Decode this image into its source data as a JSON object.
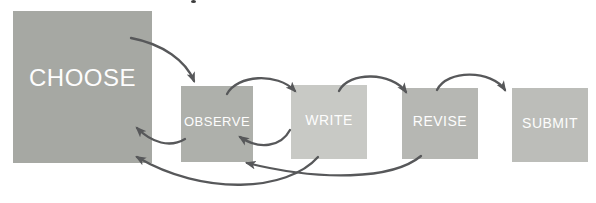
{
  "diagram": {
    "background_color": "#ffffff",
    "arrow_color": "#57585a",
    "label_color": "#fdfdfd",
    "boxes": [
      {
        "id": "choose",
        "label": "CHOOSE",
        "x": 13,
        "y": 11,
        "w": 139,
        "h": 152,
        "color": "#a6a8a3",
        "font_size": 24
      },
      {
        "id": "observe",
        "label": "OBSERVE",
        "x": 181,
        "y": 86,
        "w": 72,
        "h": 76,
        "color": "#aeb0ab",
        "font_size": 13
      },
      {
        "id": "write",
        "label": "WRITE",
        "x": 291,
        "y": 85,
        "w": 76,
        "h": 74,
        "color": "#c8c9c5",
        "font_size": 14
      },
      {
        "id": "revise",
        "label": "REVISE",
        "x": 402,
        "y": 88,
        "w": 76,
        "h": 71,
        "color": "#b6b7b3",
        "font_size": 14
      },
      {
        "id": "submit",
        "label": "SUBMIT",
        "x": 512,
        "y": 88,
        "w": 76,
        "h": 74,
        "color": "#bcbdb9",
        "font_size": 14
      }
    ],
    "arrows": [
      {
        "from": "choose",
        "to": "observe",
        "path": "M 131,38 C 163,44 186,61 194,81"
      },
      {
        "from": "observe",
        "to": "write",
        "path": "M 227,94 C 237,75 277,72 295,91"
      },
      {
        "from": "write",
        "to": "revise",
        "path": "M 339,91 C 349,71 392,72 406,92"
      },
      {
        "from": "revise",
        "to": "submit",
        "path": "M 437,90 C 447,69 492,70 505,90"
      },
      {
        "from": "observe",
        "to": "choose",
        "path": "M 185,139 C 170,148 152,143 137,128"
      },
      {
        "from": "write",
        "to": "observe",
        "path": "M 290,130 C 281,147 259,150 240,137"
      },
      {
        "from": "write",
        "to": "choose",
        "path": "M 318,157 C 287,192 203,196 137,157"
      },
      {
        "from": "revise",
        "to": "observe",
        "path": "M 421,156 C 392,180 320,181 247,163"
      }
    ]
  }
}
